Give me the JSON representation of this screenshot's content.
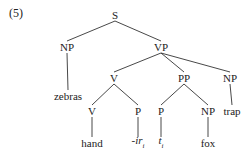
{
  "example_number": "(5)",
  "tree": {
    "nodes": [
      {
        "id": "S",
        "label": "S",
        "x": 115,
        "y": 15
      },
      {
        "id": "NP1",
        "label": "NP",
        "x": 67,
        "y": 47
      },
      {
        "id": "VP",
        "label": "VP",
        "x": 161,
        "y": 47
      },
      {
        "id": "zeb",
        "label": "zebras",
        "x": 68,
        "y": 96
      },
      {
        "id": "V1",
        "label": "V",
        "x": 114,
        "y": 78
      },
      {
        "id": "PP",
        "label": "PP",
        "x": 184,
        "y": 78
      },
      {
        "id": "NP2",
        "label": "NP",
        "x": 230,
        "y": 78
      },
      {
        "id": "V2",
        "label": "V",
        "x": 92,
        "y": 111
      },
      {
        "id": "P1",
        "label": "P",
        "x": 138,
        "y": 111
      },
      {
        "id": "P2",
        "label": "P",
        "x": 161,
        "y": 111
      },
      {
        "id": "NP3",
        "label": "NP",
        "x": 208,
        "y": 111
      },
      {
        "id": "trap",
        "label": "trap",
        "x": 232,
        "y": 111
      },
      {
        "id": "hand",
        "label": "hand",
        "x": 92,
        "y": 143
      },
      {
        "id": "ir",
        "label": "-ir",
        "sub": "i",
        "italic": true,
        "x": 138,
        "y": 143
      },
      {
        "id": "t",
        "label": "t",
        "sub": "i",
        "italic": true,
        "x": 161,
        "y": 143
      },
      {
        "id": "fox",
        "label": "fox",
        "x": 208,
        "y": 143
      }
    ],
    "edges": [
      [
        "S",
        "NP1"
      ],
      [
        "S",
        "VP"
      ],
      [
        "NP1",
        "zeb"
      ],
      [
        "VP",
        "V1"
      ],
      [
        "VP",
        "PP"
      ],
      [
        "VP",
        "NP2"
      ],
      [
        "V1",
        "V2"
      ],
      [
        "V1",
        "P1"
      ],
      [
        "PP",
        "P2"
      ],
      [
        "PP",
        "NP3"
      ],
      [
        "NP2",
        "trap"
      ],
      [
        "V2",
        "hand"
      ],
      [
        "P1",
        "ir"
      ],
      [
        "P2",
        "t"
      ],
      [
        "NP3",
        "fox"
      ]
    ]
  }
}
